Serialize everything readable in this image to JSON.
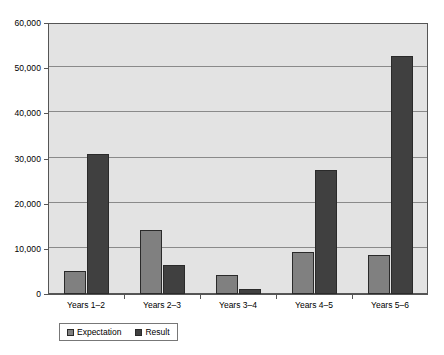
{
  "chart_data": {
    "type": "bar",
    "title": "",
    "subtitle": "",
    "xlabel": "",
    "ylabel": "",
    "categories": [
      "Years 1–2",
      "Years 2–3",
      "Years 3–4",
      "Years 4–5",
      "Years 5–6"
    ],
    "series": [
      {
        "name": "Expectation",
        "color": "#808080",
        "values": [
          5100,
          14200,
          4100,
          9300,
          8600
        ]
      },
      {
        "name": "Result",
        "color": "#404040",
        "values": [
          30900,
          6500,
          1100,
          27400,
          52800
        ]
      }
    ],
    "ylim": [
      0,
      60000
    ],
    "yticks": [
      0,
      10000,
      20000,
      30000,
      40000,
      50000,
      60000
    ],
    "ytick_labels": [
      "0",
      "10,000",
      "20,000",
      "30,000",
      "40,000",
      "50,000",
      "60,000"
    ],
    "grid": true,
    "grid_axis": "y",
    "legend_position": "bottom",
    "plot_background": "#e3e3e3",
    "page_background": "#ffffff"
  }
}
